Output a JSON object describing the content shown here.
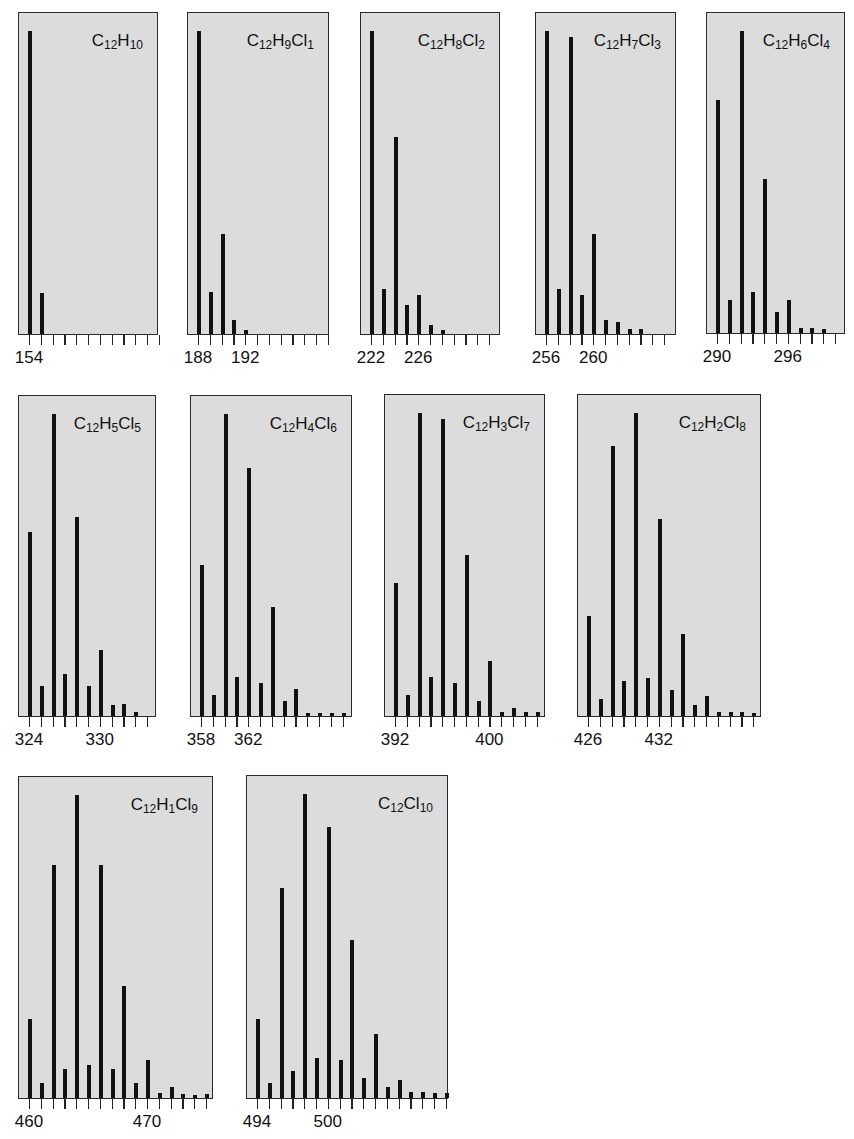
{
  "figure": {
    "panel_frame_color": "#dcdcdc",
    "bar_color": "#111111",
    "unit_px": 11.8
  },
  "chart_data": [
    {
      "type": "bar",
      "title": "C12H10",
      "formula_parts": [
        [
          "C",
          ""
        ],
        [
          "12",
          "sub"
        ],
        [
          "H",
          ""
        ],
        [
          "10",
          "sub"
        ]
      ],
      "box": {
        "x": 18,
        "y": 12,
        "w": 140,
        "h": 323
      },
      "first_mz": 154,
      "tick_count": 12,
      "labeled_ticks": [
        154
      ],
      "x": [
        154,
        155
      ],
      "values": [
        100,
        13.5
      ],
      "xlabel": "m/z",
      "ylabel": "relative intensity",
      "ylim": [
        0,
        100
      ]
    },
    {
      "type": "bar",
      "title": "C12H9Cl1",
      "formula_parts": [
        [
          "C",
          ""
        ],
        [
          "12",
          "sub"
        ],
        [
          "H",
          ""
        ],
        [
          "9",
          "sub"
        ],
        [
          "Cl",
          ""
        ],
        [
          "1",
          "sub"
        ]
      ],
      "box": {
        "x": 187,
        "y": 12,
        "w": 142,
        "h": 323
      },
      "first_mz": 188,
      "tick_count": 12,
      "labeled_ticks": [
        188,
        192
      ],
      "x": [
        188,
        189,
        190,
        191,
        192
      ],
      "values": [
        100,
        14,
        33,
        4.5,
        1.2
      ],
      "xlabel": "m/z",
      "ylabel": "relative intensity",
      "ylim": [
        0,
        100
      ]
    },
    {
      "type": "bar",
      "title": "C12H8Cl2",
      "formula_parts": [
        [
          "C",
          ""
        ],
        [
          "12",
          "sub"
        ],
        [
          "H",
          ""
        ],
        [
          "8",
          "sub"
        ],
        [
          "Cl",
          ""
        ],
        [
          "2",
          "sub"
        ]
      ],
      "box": {
        "x": 360,
        "y": 12,
        "w": 140,
        "h": 323
      },
      "first_mz": 222,
      "tick_count": 11,
      "labeled_ticks": [
        222,
        226
      ],
      "x": [
        222,
        223,
        224,
        225,
        226,
        227,
        228
      ],
      "values": [
        100,
        15,
        65,
        9.5,
        13,
        3,
        1.2
      ],
      "xlabel": "m/z",
      "ylabel": "relative intensity",
      "ylim": [
        0,
        100
      ]
    },
    {
      "type": "bar",
      "title": "C12H7Cl3",
      "formula_parts": [
        [
          "C",
          ""
        ],
        [
          "12",
          "sub"
        ],
        [
          "H",
          ""
        ],
        [
          "7",
          "sub"
        ],
        [
          "Cl",
          ""
        ],
        [
          "3",
          "sub"
        ]
      ],
      "box": {
        "x": 535,
        "y": 12,
        "w": 141,
        "h": 323
      },
      "first_mz": 256,
      "tick_count": 11,
      "labeled_ticks": [
        256,
        260
      ],
      "x": [
        256,
        257,
        258,
        259,
        260,
        261,
        262,
        263,
        264
      ],
      "values": [
        100,
        15,
        98,
        13,
        33,
        4.5,
        4,
        1.5,
        1.5
      ],
      "xlabel": "m/z",
      "ylabel": "relative intensity",
      "ylim": [
        0,
        100
      ]
    },
    {
      "type": "bar",
      "title": "C12H6Cl4",
      "formula_parts": [
        [
          "C",
          ""
        ],
        [
          "12",
          "sub"
        ],
        [
          "H",
          ""
        ],
        [
          "6",
          "sub"
        ],
        [
          "Cl",
          ""
        ],
        [
          "4",
          "sub"
        ]
      ],
      "box": {
        "x": 706,
        "y": 12,
        "w": 139,
        "h": 322
      },
      "first_mz": 290,
      "tick_count": 11,
      "labeled_ticks": [
        290,
        296
      ],
      "x": [
        290,
        291,
        292,
        293,
        294,
        295,
        296,
        297,
        298,
        299
      ],
      "values": [
        77,
        11,
        100,
        13.5,
        51,
        7,
        11,
        1.5,
        1.5,
        1.2
      ],
      "xlabel": "m/z",
      "ylabel": "relative intensity",
      "ylim": [
        0,
        100
      ]
    },
    {
      "type": "bar",
      "title": "C12H5Cl5",
      "formula_parts": [
        [
          "C",
          ""
        ],
        [
          "12",
          "sub"
        ],
        [
          "H",
          ""
        ],
        [
          "5",
          "sub"
        ],
        [
          "Cl",
          ""
        ],
        [
          "5",
          "sub"
        ]
      ],
      "box": {
        "x": 18,
        "y": 395,
        "w": 138,
        "h": 322
      },
      "first_mz": 324,
      "tick_count": 11,
      "labeled_ticks": [
        324,
        330
      ],
      "x": [
        324,
        325,
        326,
        327,
        328,
        329,
        330,
        331,
        332,
        333
      ],
      "values": [
        61,
        10,
        100,
        14,
        66,
        10,
        22,
        3.5,
        4,
        1.2
      ],
      "xlabel": "m/z",
      "ylabel": "relative intensity",
      "ylim": [
        0,
        100
      ]
    },
    {
      "type": "bar",
      "title": "C12H4Cl6",
      "formula_parts": [
        [
          "C",
          ""
        ],
        [
          "12",
          "sub"
        ],
        [
          "H",
          ""
        ],
        [
          "4",
          "sub"
        ],
        [
          "Cl",
          ""
        ],
        [
          "6",
          "sub"
        ]
      ],
      "box": {
        "x": 190,
        "y": 395,
        "w": 162,
        "h": 322
      },
      "first_mz": 358,
      "tick_count": 13,
      "labeled_ticks": [
        358,
        362
      ],
      "x": [
        358,
        359,
        360,
        361,
        362,
        363,
        364,
        365,
        366,
        367,
        368,
        369,
        370
      ],
      "values": [
        50,
        7,
        100,
        13,
        82,
        11,
        36,
        5,
        9,
        1,
        1,
        1,
        1
      ],
      "xlabel": "m/z",
      "ylabel": "relative intensity",
      "ylim": [
        0,
        100
      ]
    },
    {
      "type": "bar",
      "title": "C12H3Cl7",
      "formula_parts": [
        [
          "C",
          ""
        ],
        [
          "12",
          "sub"
        ],
        [
          "H",
          ""
        ],
        [
          "3",
          "sub"
        ],
        [
          "Cl",
          ""
        ],
        [
          "7",
          "sub"
        ]
      ],
      "box": {
        "x": 384,
        "y": 394,
        "w": 161,
        "h": 323
      },
      "first_mz": 392,
      "tick_count": 13,
      "labeled_ticks": [
        392,
        400
      ],
      "x": [
        392,
        393,
        394,
        395,
        396,
        397,
        398,
        399,
        400,
        401,
        402,
        403,
        404
      ],
      "values": [
        44,
        7,
        100,
        13,
        98,
        11,
        53,
        5,
        18,
        1.2,
        2.5,
        1.2,
        1.2
      ],
      "xlabel": "m/z",
      "ylabel": "relative intensity",
      "ylim": [
        0,
        100
      ]
    },
    {
      "type": "bar",
      "title": "C12H2Cl8",
      "formula_parts": [
        [
          "C",
          ""
        ],
        [
          "12",
          "sub"
        ],
        [
          "H",
          ""
        ],
        [
          "2",
          "sub"
        ],
        [
          "Cl",
          ""
        ],
        [
          "8",
          "sub"
        ]
      ],
      "box": {
        "x": 577,
        "y": 394,
        "w": 184,
        "h": 323
      },
      "first_mz": 426,
      "tick_count": 15,
      "labeled_ticks": [
        426,
        432
      ],
      "x": [
        426,
        427,
        428,
        429,
        430,
        431,
        432,
        433,
        434,
        435,
        436,
        437,
        438,
        439,
        440
      ],
      "values": [
        33,
        5.5,
        89,
        11.5,
        100,
        12.5,
        65,
        8.5,
        27,
        3.5,
        6.5,
        1.2,
        1.2,
        1.2,
        1
      ],
      "xlabel": "m/z",
      "ylabel": "relative intensity",
      "ylim": [
        0,
        100
      ]
    },
    {
      "type": "bar",
      "title": "C12H1Cl9",
      "formula_parts": [
        [
          "C",
          ""
        ],
        [
          "12",
          "sub"
        ],
        [
          "H",
          ""
        ],
        [
          "1",
          "sub"
        ],
        [
          "Cl",
          ""
        ],
        [
          "9",
          "sub"
        ]
      ],
      "box": {
        "x": 18,
        "y": 776,
        "w": 195,
        "h": 323
      },
      "first_mz": 460,
      "tick_count": 16,
      "labeled_ticks": [
        460,
        470
      ],
      "x": [
        460,
        461,
        462,
        463,
        464,
        465,
        466,
        467,
        468,
        469,
        470,
        471,
        472,
        473,
        474,
        475
      ],
      "values": [
        26,
        5,
        77,
        9.5,
        100,
        11,
        77,
        9.5,
        37,
        5,
        12.5,
        1.5,
        3.5,
        1.2,
        1,
        1.2
      ],
      "xlabel": "m/z",
      "ylabel": "relative intensity",
      "ylim": [
        0,
        100
      ]
    },
    {
      "type": "bar",
      "title": "C12Cl10",
      "formula_parts": [
        [
          "C",
          ""
        ],
        [
          "12",
          "sub"
        ],
        [
          "Cl",
          ""
        ],
        [
          "10",
          "sub"
        ]
      ],
      "box": {
        "x": 246,
        "y": 775,
        "w": 202,
        "h": 324
      },
      "first_mz": 494,
      "tick_count": 17,
      "labeled_ticks": [
        494,
        500
      ],
      "x": [
        494,
        495,
        496,
        497,
        498,
        499,
        500,
        501,
        502,
        503,
        504,
        505,
        506,
        507,
        508,
        509,
        510
      ],
      "values": [
        26,
        5,
        69,
        9,
        100,
        13,
        89,
        12.5,
        52,
        6.5,
        21,
        3.5,
        6,
        2,
        2,
        1.5,
        1.5
      ],
      "xlabel": "m/z",
      "ylabel": "relative intensity",
      "ylim": [
        0,
        100
      ]
    }
  ]
}
